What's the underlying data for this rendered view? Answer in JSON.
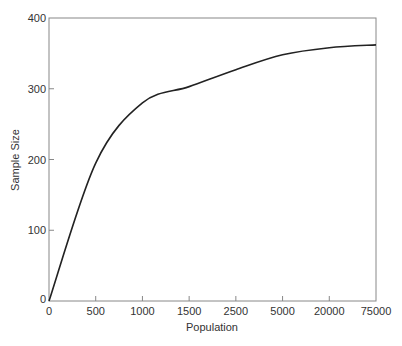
{
  "chart_data": {
    "type": "line",
    "title": "",
    "xlabel": "Population",
    "ylabel": "Sample Size",
    "x_scale": "ordinal (non-linear, evenly spaced ticks)",
    "x_ticks": [
      "0",
      "500",
      "1000",
      "1500",
      "2500",
      "5000",
      "20000",
      "75000"
    ],
    "y_ticks": [
      "0",
      "100",
      "200",
      "300",
      "400"
    ],
    "ylim": [
      0,
      400
    ],
    "grid": false,
    "legend": null,
    "series": [
      {
        "name": "Sample Size",
        "x": [
          0,
          500,
          1000,
          1500,
          2500,
          5000,
          20000,
          75000
        ],
        "values": [
          0,
          195,
          280,
          303,
          327,
          348,
          358,
          362
        ]
      }
    ],
    "line_color": "#222222",
    "frame_color": "#888888"
  }
}
